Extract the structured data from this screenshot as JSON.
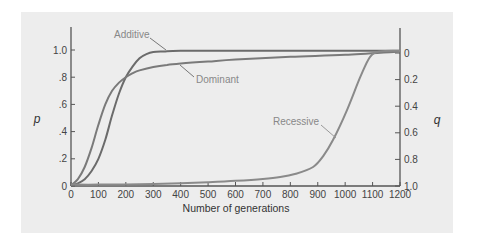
{
  "chart_data": {
    "type": "line",
    "title": "",
    "xlabel": "Number of generations",
    "ylabel": "p",
    "ylabel_right": "q",
    "xlim": [
      0,
      1200
    ],
    "ylim": [
      0,
      1.0
    ],
    "ylim_right": [
      1.0,
      0
    ],
    "x_ticks": [
      0,
      100,
      200,
      300,
      400,
      500,
      600,
      700,
      800,
      900,
      1000,
      1100,
      1200
    ],
    "x_tick_labels": [
      "0",
      "100",
      "200",
      "300",
      "400",
      "500",
      "600",
      "700",
      "800",
      "900",
      "1000",
      "1100",
      "1200"
    ],
    "y_ticks": [
      0,
      0.2,
      0.4,
      0.6,
      0.8,
      1.0
    ],
    "y_tick_labels": [
      "0",
      ".2",
      ".4",
      ".6",
      ".8",
      "1.0"
    ],
    "y_right_ticks": [
      0,
      0.2,
      0.4,
      0.6,
      0.8,
      1.0
    ],
    "y_right_tick_labels": [
      "0",
      "0.2",
      "0.4",
      "0.6",
      "0.8",
      "1.0"
    ],
    "grid": false,
    "legend": "inline-labels",
    "series": [
      {
        "name": "Additive",
        "x": [
          0,
          25,
          50,
          75,
          100,
          125,
          150,
          175,
          200,
          225,
          250,
          275,
          300,
          340,
          400,
          600,
          800,
          1000,
          1200
        ],
        "y": [
          0.005,
          0.02,
          0.05,
          0.11,
          0.2,
          0.34,
          0.52,
          0.68,
          0.8,
          0.88,
          0.94,
          0.97,
          0.985,
          0.99,
          0.995,
          0.995,
          0.995,
          0.995,
          0.995
        ]
      },
      {
        "name": "Dominant",
        "x": [
          0,
          25,
          50,
          75,
          100,
          125,
          150,
          175,
          200,
          225,
          250,
          300,
          350,
          400,
          500,
          600,
          800,
          1000,
          1200
        ],
        "y": [
          0.005,
          0.05,
          0.14,
          0.28,
          0.45,
          0.6,
          0.7,
          0.76,
          0.8,
          0.83,
          0.85,
          0.875,
          0.89,
          0.9,
          0.915,
          0.93,
          0.95,
          0.965,
          0.99
        ]
      },
      {
        "name": "Recessive",
        "x": [
          0,
          100,
          200,
          300,
          400,
          500,
          600,
          700,
          763,
          820,
          883,
          920,
          956,
          1007,
          1055,
          1091,
          1128,
          1200
        ],
        "y": [
          0.01,
          0.01,
          0.012,
          0.015,
          0.02,
          0.028,
          0.038,
          0.052,
          0.066,
          0.09,
          0.14,
          0.22,
          0.34,
          0.56,
          0.8,
          0.95,
          0.99,
          0.995
        ]
      }
    ],
    "annotations": [
      {
        "text": "Additive",
        "series": "Additive"
      },
      {
        "text": "Dominant",
        "series": "Dominant"
      },
      {
        "text": "Recessive",
        "series": "Recessive"
      }
    ]
  }
}
